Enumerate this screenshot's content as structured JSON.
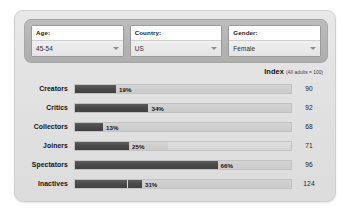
{
  "filters": [
    {
      "label": "Age:",
      "value": "45-54",
      "name": "age"
    },
    {
      "label": "Country:",
      "value": "US",
      "name": "country"
    },
    {
      "label": "Gender:",
      "value": "Female",
      "name": "gender"
    }
  ],
  "index_header": {
    "title": "Index",
    "note": "(All adults = 100)"
  },
  "colors": {
    "panel_bg": "#e4e4e4",
    "filter_bar_bg": "#b4b4b4",
    "bar_fill": "#4a4a4a",
    "bar_track": "#d0d0d0",
    "text": "#111111"
  },
  "chart_data": {
    "type": "bar",
    "xlabel": "",
    "ylabel": "",
    "xlim": [
      0,
      100
    ],
    "grid": false,
    "orientation": "horizontal",
    "value_suffix": "%",
    "categories": [
      "Creators",
      "Critics",
      "Collectors",
      "Joiners",
      "Spectators",
      "Inactives"
    ],
    "values": [
      19,
      34,
      13,
      25,
      66,
      31
    ],
    "value_labels": [
      "19%",
      "34%",
      "13%",
      "25%",
      "66%",
      "31%"
    ],
    "index_label": "Index (All adults = 100)",
    "index_values": [
      90,
      92,
      68,
      71,
      96,
      124
    ],
    "series": [
      {
        "name": "Percent of online adults",
        "values": [
          19,
          34,
          13,
          25,
          66,
          31
        ]
      },
      {
        "name": "Index (All adults = 100)",
        "values": [
          90,
          92,
          68,
          71,
          96,
          124
        ]
      }
    ],
    "rows": [
      {
        "category": "Creators",
        "value": 19,
        "label": "19%",
        "index": 90,
        "track_tail_pct": 0,
        "divider_at_pct": null
      },
      {
        "category": "Critics",
        "value": 34,
        "label": "34%",
        "index": 92,
        "track_tail_pct": 0,
        "divider_at_pct": null
      },
      {
        "category": "Collectors",
        "value": 13,
        "label": "13%",
        "index": 68,
        "track_tail_pct": 0,
        "divider_at_pct": null
      },
      {
        "category": "Joiners",
        "value": 25,
        "label": "25%",
        "index": 71,
        "track_tail_pct": 57,
        "divider_at_pct": null
      },
      {
        "category": "Spectators",
        "value": 66,
        "label": "66%",
        "index": 96,
        "track_tail_pct": 0,
        "divider_at_pct": null
      },
      {
        "category": "Inactives",
        "value": 31,
        "label": "31%",
        "index": 124,
        "track_tail_pct": 0,
        "divider_at_pct": 24
      }
    ]
  }
}
